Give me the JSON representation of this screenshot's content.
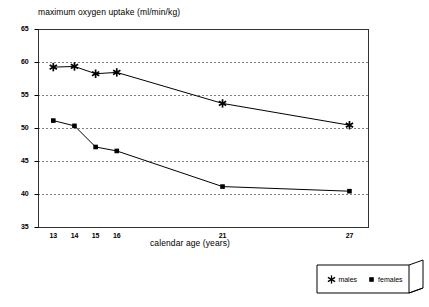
{
  "chart_data": {
    "type": "line",
    "title": "maximum oxygen uptake (ml/min/kg)",
    "xlabel": "calendar age (years)",
    "ylabel": "",
    "x": [
      13,
      14,
      15,
      16,
      21,
      27
    ],
    "xtick_labels": [
      "13",
      "14",
      "15",
      "16",
      "21",
      "27"
    ],
    "ytick_labels": [
      "65",
      "60",
      "55",
      "50",
      "45",
      "40",
      "35"
    ],
    "yticks": [
      65,
      60,
      55,
      50,
      45,
      40,
      35
    ],
    "xlim": [
      12.3,
      27.9
    ],
    "ylim": [
      35,
      65
    ],
    "grid": "horizontal-dotted",
    "legend_position": "below-right-outside",
    "series": [
      {
        "name": "males",
        "marker": "asterisk",
        "color": "#000000",
        "values": [
          59.3,
          59.4,
          58.3,
          58.5,
          53.8,
          50.5
        ]
      },
      {
        "name": "females",
        "marker": "square",
        "color": "#000000",
        "values": [
          51.2,
          50.4,
          47.2,
          46.6,
          41.2,
          40.5
        ]
      }
    ]
  },
  "legend": {
    "males_label": "males",
    "females_label": "females"
  }
}
